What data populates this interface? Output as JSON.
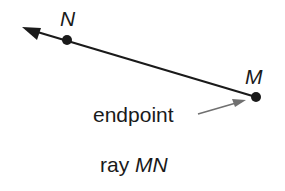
{
  "diagram": {
    "points": [
      {
        "id": "N",
        "label": "N",
        "x": 67,
        "y": 40
      },
      {
        "id": "M",
        "label": "M",
        "x": 256,
        "y": 97
      }
    ],
    "ray": {
      "name": "MN",
      "endpoint": "M",
      "through": "N",
      "direction": "toward N (upper-left)"
    },
    "annotation": {
      "text": "endpoint",
      "points_to": "M"
    },
    "caption": {
      "prefix": "ray ",
      "name": "MN"
    },
    "colors": {
      "line": "#1a1a1a",
      "annotation_arrow": "#707070"
    }
  }
}
